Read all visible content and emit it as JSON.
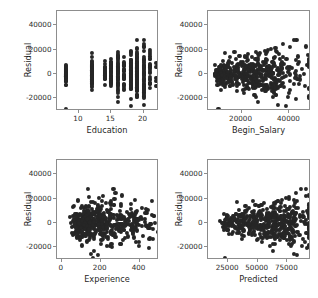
{
  "figure": {
    "background_color": "#ffffff",
    "marker_color": "#262626",
    "axis_color": "#8d8d8d",
    "layout": "2x2 grid of residual diagnostic scatter plots"
  },
  "chart_data": [
    {
      "type": "scatter",
      "title": "",
      "xlabel": "Education",
      "ylabel": "Residual",
      "xlim": [
        6.6,
        22.4
      ],
      "ylim": [
        -31000,
        52000
      ],
      "xticks": [
        10,
        15,
        20
      ],
      "xtick_labels": [
        "10",
        "15",
        "20"
      ],
      "yticks": [
        -20000,
        0,
        20000,
        40000
      ],
      "ytick_labels": [
        "-20000",
        "0",
        "20000",
        "40000"
      ],
      "grid": false,
      "legend": "none",
      "x": [
        8,
        8,
        8,
        8,
        8,
        8,
        8,
        8,
        8,
        8,
        8,
        8,
        8,
        8,
        8,
        8,
        8,
        8,
        8,
        8,
        8,
        8,
        8,
        8,
        8,
        8,
        8,
        8,
        8,
        8,
        8,
        8,
        8,
        8,
        8,
        8,
        8,
        8,
        8,
        8,
        8,
        8,
        8,
        8,
        8,
        8,
        8,
        8,
        8,
        8,
        8,
        8,
        12,
        12,
        12,
        12,
        12,
        12,
        12,
        12,
        12,
        12,
        12,
        12,
        12,
        12,
        12,
        12,
        12,
        12,
        12,
        12,
        12,
        12,
        12,
        12,
        12,
        12,
        12,
        12,
        12,
        12,
        12,
        12,
        12,
        12,
        12,
        12,
        12,
        12,
        12,
        12,
        12,
        12,
        12,
        12,
        12,
        12,
        12,
        12,
        12,
        12,
        12,
        12,
        12,
        12,
        12,
        12,
        12,
        12,
        12,
        12,
        14,
        14,
        14,
        14,
        14,
        14,
        14,
        14,
        14,
        14,
        14,
        14,
        14,
        14,
        14,
        14,
        14,
        14,
        15,
        15,
        15,
        15,
        15,
        15,
        15,
        15,
        15,
        15,
        15,
        15,
        15,
        15,
        15,
        15,
        15,
        15,
        15,
        15,
        15,
        15,
        15,
        15,
        15,
        15,
        15,
        15,
        15,
        15,
        15,
        15,
        15,
        15,
        15,
        15,
        16,
        16,
        16,
        16,
        16,
        16,
        16,
        16,
        16,
        16,
        16,
        16,
        16,
        16,
        16,
        16,
        16,
        16,
        16,
        16,
        16,
        16,
        16,
        16,
        16,
        16,
        16,
        16,
        16,
        16,
        16,
        16,
        16,
        16,
        16,
        16,
        16,
        16,
        16,
        16,
        16,
        16,
        16,
        16,
        16,
        16,
        16,
        16,
        17,
        17,
        17,
        17,
        17,
        17,
        17,
        17,
        17,
        17,
        17,
        17,
        17,
        17,
        18,
        18,
        18,
        18,
        18,
        18,
        18,
        18,
        18,
        18,
        18,
        18,
        18,
        18,
        18,
        18,
        18,
        18,
        18,
        18,
        18,
        18,
        18,
        18,
        18,
        18,
        18,
        18,
        19,
        19,
        19,
        19,
        19,
        19,
        19,
        19,
        19,
        19,
        19,
        19,
        19,
        19,
        19,
        19,
        19,
        19,
        19,
        19,
        19,
        19,
        19,
        19,
        19,
        19,
        19,
        19,
        19,
        19,
        20,
        20,
        20,
        20,
        20,
        20,
        20,
        20,
        21,
        21,
        21,
        22
      ],
      "y": [
        6900,
        6200,
        5500,
        4800,
        4200,
        3600,
        3000,
        2500,
        2000,
        1500,
        1000,
        600,
        200,
        -200,
        -600,
        -1000,
        -1400,
        -1800,
        -2200,
        -2600,
        -3000,
        -3400,
        -3800,
        -4200,
        -4600,
        -5000,
        -5400,
        -5800,
        -6200,
        5900,
        5100,
        4400,
        3700,
        3100,
        2600,
        2100,
        1700,
        1300,
        900,
        500,
        100,
        -300,
        -700,
        -1100,
        -1500,
        -1900,
        -2300,
        -2700,
        -3100,
        -3500,
        -3900,
        -4300,
        13500,
        12000,
        11000,
        10000,
        9200,
        8400,
        7600,
        6900,
        6200,
        5600,
        5000,
        4400,
        3900,
        3400,
        2900,
        2400,
        2000,
        1600,
        1200,
        800,
        400,
        0,
        -400,
        -800,
        -1200,
        -1600,
        -2000,
        -2400,
        -2800,
        -3200,
        -3600,
        -4000,
        -4400,
        -4800,
        -5200,
        -5600,
        -6000,
        -6400,
        -6800,
        -7200,
        -7600,
        -8000,
        -8500,
        -9000,
        -9500,
        -10000,
        -10800,
        -11600,
        12500,
        11200,
        10200,
        9400,
        8600,
        7800,
        7000,
        6300,
        5600,
        5000,
        4400,
        3800,
        3200,
        2600,
        2000,
        1400,
        800,
        200,
        -400,
        -1000,
        -1600,
        -2200,
        -2800,
        -3400,
        -4000,
        -4600,
        -5200,
        -5800,
        -6400,
        -7000,
        -7800,
        -8600,
        14800,
        9000,
        7500,
        6000,
        4500,
        3200,
        2000,
        900,
        0,
        -900,
        -1800,
        -2700,
        -3600,
        -4500,
        -5400,
        -6300,
        -7400,
        -8600,
        45500,
        37800,
        27500,
        24000,
        21500,
        19500,
        17500,
        16000,
        14500,
        13000,
        11500,
        10000,
        8800,
        7600,
        6500,
        5400,
        4400,
        3400,
        2400,
        1400,
        500,
        -400,
        -1300,
        -2200,
        -3100,
        -4000,
        -5000,
        -6000,
        -7000,
        -8000,
        -9000,
        -10000,
        -11200,
        -12500,
        -20800,
        -26500,
        47000,
        46000,
        21000,
        19000,
        17500,
        16000,
        14500,
        13200,
        12000,
        10800,
        9700,
        8600,
        7600,
        6600,
        5600,
        4700,
        3800,
        2900,
        2000,
        1100,
        300,
        -500,
        -1300,
        -2100,
        -2900,
        -3700,
        -4500,
        -5300,
        -6200,
        -7100,
        -8000,
        -8900,
        -9900,
        -10900,
        -12000,
        -13200,
        -21000,
        22500,
        18500,
        15000,
        12500,
        10500,
        8800,
        7200,
        5800,
        4400,
        3000,
        1700,
        400,
        -900,
        -2300,
        20500,
        18000,
        16000,
        14000,
        12500,
        11000,
        9600,
        8300,
        7000,
        5800,
        4600,
        3400,
        2200,
        1000,
        -200,
        -1400,
        -2600,
        -3800,
        -5000,
        -6200,
        -7400,
        -8600,
        -10000,
        -11400,
        -13000,
        -15000,
        -21200,
        -21500,
        29500,
        27000,
        24500,
        20500,
        18000,
        16000,
        14000,
        12000,
        10500,
        9000,
        7600,
        6200,
        4800,
        3400,
        2000,
        600,
        -800,
        -2200,
        -3600,
        -5000,
        -6400,
        -7800,
        -9200,
        -10800,
        -12400,
        -14200,
        -16500,
        -18500,
        -20500,
        -22000,
        20200,
        13500,
        9000,
        4000,
        -500,
        -5500,
        -10500,
        -16500,
        13000,
        -4500,
        -9800,
        -26500
      ]
    },
    {
      "type": "scatter",
      "title": "",
      "xlabel": "Begin_Salary",
      "ylabel": "Residual",
      "xlim": [
        6000,
        49000
      ],
      "ylim": [
        -31000,
        52000
      ],
      "xticks": [
        20000,
        40000
      ],
      "xtick_labels": [
        "20000",
        "40000"
      ],
      "yticks": [
        -20000,
        0,
        20000,
        40000
      ],
      "ytick_labels": [
        "-20000",
        "0",
        "20000",
        "40000"
      ],
      "grid": false,
      "legend": "none",
      "note": "dense cluster below 20000 begin salary; spread widens at higher salaries"
    },
    {
      "type": "scatter",
      "title": "",
      "xlabel": "Experience",
      "ylabel": "Residual",
      "xlim": [
        -25,
        500
      ],
      "ylim": [
        -31000,
        52000
      ],
      "xticks": [
        0,
        200,
        400
      ],
      "xtick_labels": [
        "0",
        "200",
        "400"
      ],
      "yticks": [
        -20000,
        0,
        20000,
        40000
      ],
      "ytick_labels": [
        "-20000",
        "0",
        "20000",
        "40000"
      ],
      "grid": false,
      "legend": "none",
      "note": "dense cluster at low experience, narrowing band extends to the right"
    },
    {
      "type": "scatter",
      "title": "",
      "xlabel": "Predicted",
      "ylabel": "Residual",
      "xlim": [
        8000,
        95000
      ],
      "ylim": [
        -31000,
        52000
      ],
      "xticks": [
        25000,
        50000,
        75000
      ],
      "xtick_labels": [
        "25000",
        "50000",
        "75000"
      ],
      "yticks": [
        -20000,
        0,
        20000,
        40000
      ],
      "ytick_labels": [
        "-20000",
        "0",
        "20000",
        "40000"
      ],
      "grid": false,
      "legend": "none",
      "note": "fan-shaped heteroscedastic residual spread increasing with predicted value"
    }
  ]
}
